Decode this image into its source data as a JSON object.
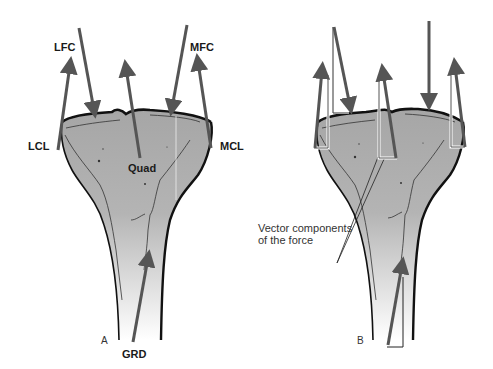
{
  "figure": {
    "colors": {
      "arrow": "#555555",
      "bone_fill_top": "#a8a8a8",
      "bone_fill_bottom": "#f4f4f4",
      "outline": "#111111",
      "component_line": "#ffffff"
    }
  },
  "panel_a": {
    "label": "A",
    "forces": {
      "lfc": "LFC",
      "mfc": "MFC",
      "lcl": "LCL",
      "mcl": "MCL",
      "quad": "Quad",
      "grd": "GRD"
    }
  },
  "panel_b": {
    "label": "B",
    "annotation_line1": "Vector components",
    "annotation_line2": "of the force"
  }
}
